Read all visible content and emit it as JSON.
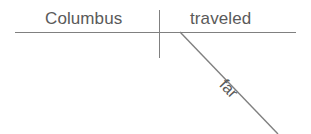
{
  "diagram": {
    "type": "reed-kellogg-sentence-diagram",
    "sentence": "Columbus traveled far",
    "background_color": "#ffffff",
    "line_color": "#808080",
    "text_color": "#5a5a5a",
    "baseline": {
      "name": "main-baseline",
      "x1": 15,
      "y1": 32,
      "x2": 296,
      "y2": 32
    },
    "subject_verb_divider": {
      "name": "subject-verb-divider",
      "x1": 159,
      "y1": 10,
      "x2": 159,
      "y2": 58
    },
    "modifier_slant": {
      "name": "adverb-slant-line",
      "x1": 180,
      "y1": 32,
      "x2": 278,
      "y2": 134
    },
    "labels": {
      "subject": "Columbus",
      "verb": "traveled",
      "modifier": "far"
    }
  }
}
